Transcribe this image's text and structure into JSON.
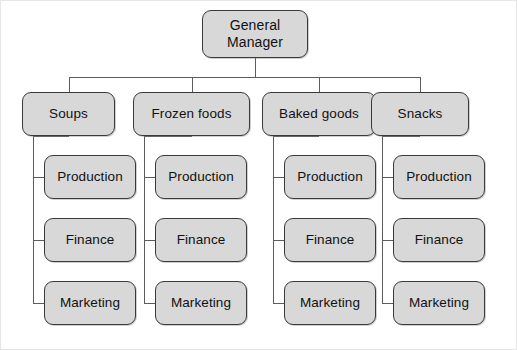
{
  "diagram": {
    "title_node": {
      "label": "General\nManager",
      "name": "general-manager"
    },
    "divisions": [
      {
        "label": "Soups",
        "name": "soups"
      },
      {
        "label": "Frozen foods",
        "name": "frozen-foods"
      },
      {
        "label": "Baked goods",
        "name": "baked-goods"
      },
      {
        "label": "Snacks",
        "name": "snacks"
      }
    ],
    "functions": [
      {
        "label": "Production",
        "name": "production"
      },
      {
        "label": "Finance",
        "name": "finance"
      },
      {
        "label": "Marketing",
        "name": "marketing"
      }
    ],
    "colors": {
      "node_fill": "#d8d8d8",
      "node_border": "#3a3a3a",
      "connector": "#5c5c5c",
      "background": "#ffffff",
      "text": "#111111"
    },
    "layout": {
      "root": {
        "x": 202,
        "y": 10,
        "w": 106,
        "h": 48
      },
      "bus_y": 77,
      "bus_left": 70,
      "bus_right": 421,
      "division_y": 92,
      "division_h": 44,
      "division_x": [
        22,
        133,
        262,
        371
      ],
      "division_w": [
        93,
        117,
        114,
        98
      ],
      "function_ys": [
        155,
        218,
        281
      ],
      "function_h": 44,
      "function_x": [
        44,
        155,
        284,
        393
      ],
      "function_w": [
        92,
        92,
        92,
        92
      ],
      "spine_x": [
        33,
        144,
        273,
        382
      ]
    }
  }
}
